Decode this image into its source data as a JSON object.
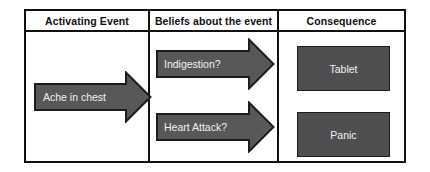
{
  "diagram": {
    "columns": [
      {
        "header": "Activating Event"
      },
      {
        "header": "Beliefs about the event"
      },
      {
        "header": "Consequence"
      }
    ],
    "activating_event": {
      "arrow": {
        "label": "Ache in chest",
        "shape": "right-block-arrow",
        "fill": "#58585a",
        "stroke": "#1d1d1d",
        "text_color": "#f2f2f2"
      }
    },
    "beliefs": {
      "arrows": [
        {
          "label": "Indigestion?",
          "shape": "right-block-arrow",
          "fill": "#58585a",
          "stroke": "#1d1d1d",
          "text_color": "#f2f2f2"
        },
        {
          "label": "Heart Attack?",
          "shape": "right-block-arrow",
          "fill": "#58585a",
          "stroke": "#1d1d1d",
          "text_color": "#f2f2f2"
        }
      ]
    },
    "consequence": {
      "boxes": [
        {
          "label": "Tablet",
          "fill": "#4f4f51",
          "stroke": "#1d1d1d",
          "text_color": "#f2f2f2"
        },
        {
          "label": "Panic",
          "fill": "#4f4f51",
          "stroke": "#1d1d1d",
          "text_color": "#f2f2f2"
        }
      ]
    },
    "style": {
      "background": "#ffffff",
      "frame_color": "#101010",
      "header_text_color": "#101010"
    }
  }
}
